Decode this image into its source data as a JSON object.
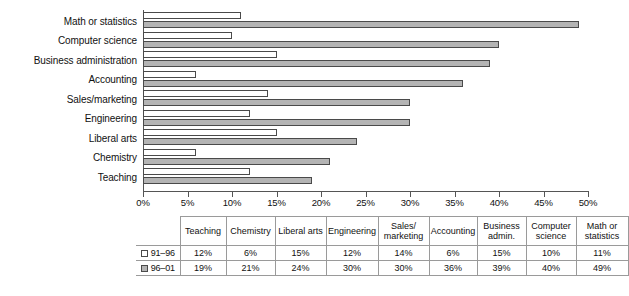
{
  "chart_data": {
    "type": "bar",
    "orientation": "horizontal",
    "title": "",
    "xlabel": "",
    "ylabel": "",
    "xlim": [
      0,
      50
    ],
    "xtick_labels": [
      "0%",
      "5%",
      "10%",
      "15%",
      "20%",
      "25%",
      "30%",
      "35%",
      "40%",
      "45%",
      "50%"
    ],
    "xticks": [
      0,
      5,
      10,
      15,
      20,
      25,
      30,
      35,
      40,
      45,
      50
    ],
    "grid": false,
    "legend_position": "table-left",
    "categories": [
      "Math or statistics",
      "Computer science",
      "Business administration",
      "Accounting",
      "Sales/marketing",
      "Engineering",
      "Liberal arts",
      "Chemistry",
      "Teaching"
    ],
    "series": [
      {
        "name": "91–96",
        "color": "#ffffff",
        "values": [
          11,
          10,
          15,
          6,
          14,
          12,
          15,
          6,
          12
        ]
      },
      {
        "name": "96–01",
        "color": "#b4b4b4",
        "values": [
          49,
          40,
          39,
          36,
          30,
          30,
          24,
          21,
          19
        ]
      }
    ]
  },
  "table": {
    "columns": [
      "Teaching",
      "Chemistry",
      "Liberal arts",
      "Engineering",
      "Sales/ marketing",
      "Accounting",
      "Business admin.",
      "Computer science",
      "Math or statistics"
    ],
    "rows": [
      {
        "label": "91–96",
        "swatch": "white-square",
        "values": [
          "12%",
          "6%",
          "15%",
          "12%",
          "14%",
          "6%",
          "15%",
          "10%",
          "11%"
        ]
      },
      {
        "label": "96–01",
        "swatch": "gray-square",
        "values": [
          "19%",
          "21%",
          "24%",
          "30%",
          "30%",
          "36%",
          "39%",
          "40%",
          "49%"
        ]
      }
    ]
  },
  "colors": {
    "series_91_96": "#ffffff",
    "series_96_01": "#b4b4b4",
    "outline": "#4a4a4a",
    "axis": "#555555",
    "table_border": "#9a9a9a",
    "background": "#ffffff"
  }
}
